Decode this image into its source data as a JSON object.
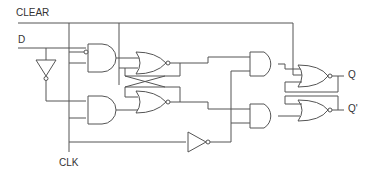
{
  "diagram": {
    "labels": {
      "clear": "CLEAR",
      "d": "D",
      "clk": "CLK",
      "q": "Q",
      "q_bar": "Q'"
    },
    "components": [
      {
        "type": "NOT",
        "name": "d-inverter"
      },
      {
        "type": "AND",
        "name": "master-and-top",
        "inputs": [
          "D",
          "CLK"
        ],
        "inverted_input": "CLK"
      },
      {
        "type": "AND",
        "name": "master-and-bottom",
        "inputs": [
          "D'",
          "CLK"
        ]
      },
      {
        "type": "NOR",
        "name": "master-nor-top"
      },
      {
        "type": "NOR",
        "name": "master-nor-bottom"
      },
      {
        "type": "AND",
        "name": "slave-and-top"
      },
      {
        "type": "AND",
        "name": "slave-and-bottom"
      },
      {
        "type": "NOT",
        "name": "clk-inverter"
      },
      {
        "type": "NOR",
        "name": "slave-nor-top",
        "output": "Q"
      },
      {
        "type": "NOR",
        "name": "slave-nor-bottom",
        "output": "Q'"
      }
    ],
    "colors": {
      "wire": "#555555",
      "text": "#333333",
      "background": "#ffffff"
    }
  }
}
